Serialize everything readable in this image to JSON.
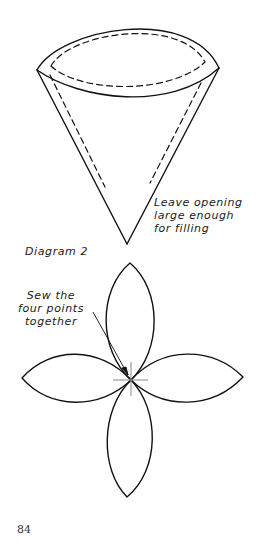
{
  "diagram1": {
    "name": "cone",
    "annotation": {
      "lines": [
        "Leave opening",
        "large enough",
        "for filling"
      ]
    }
  },
  "diagram2": {
    "label": "Diagram 2",
    "annotation": {
      "lines": [
        "Sew the",
        "four points",
        "together"
      ]
    },
    "petals": 4
  },
  "page": {
    "number": "84"
  },
  "colors": {
    "ink": "#111111",
    "paper": "#ffffff",
    "crosshair": "#888888"
  }
}
